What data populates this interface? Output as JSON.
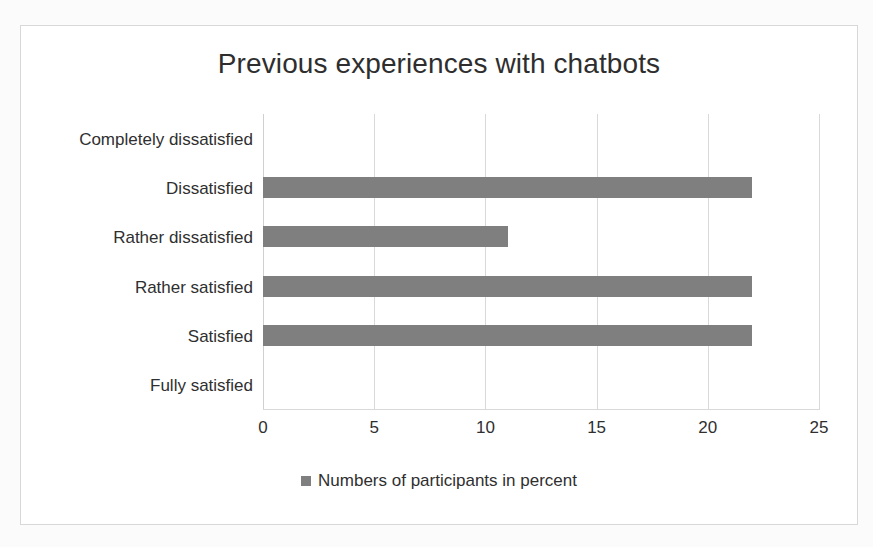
{
  "chart_data": {
    "type": "bar",
    "orientation": "horizontal",
    "title": "Previous experiences with chatbots",
    "xlabel": "",
    "ylabel": "",
    "xlim": [
      0,
      25
    ],
    "xticks": [
      "0",
      "5",
      "10",
      "15",
      "20",
      "25"
    ],
    "xtick_values": [
      0,
      5,
      10,
      15,
      20,
      25
    ],
    "grid": "vertical",
    "legend_position": "bottom",
    "legend": [
      "Numbers of participants in percent"
    ],
    "categories": [
      "Completely dissatisfied",
      "Dissatisfied",
      "Rather dissatisfied",
      "Rather satisfied",
      "Satisfied",
      "Fully satisfied"
    ],
    "series": [
      {
        "name": "Numbers of participants in percent",
        "color": "#7f7f7f",
        "values": [
          0,
          22,
          11,
          22,
          22,
          0
        ]
      }
    ]
  },
  "colors": {
    "bar": "#7f7f7f",
    "gridline": "#d9d9d9",
    "text": "#2f2f2f",
    "frame_border": "#d8d8d8",
    "plot_background": "#ffffff"
  }
}
